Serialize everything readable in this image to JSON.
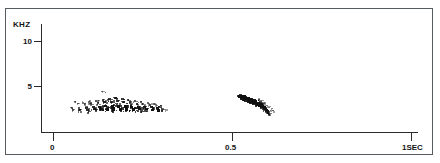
{
  "figure": {
    "type": "spectrogram",
    "background_color": "#ffffff",
    "ink_color": "#101010",
    "frame_color": "#555b5e",
    "axis_color": "#2b2b2b"
  },
  "yaxis": {
    "unit_label": "KHZ",
    "ticks": [
      {
        "label": "10",
        "value": 10
      },
      {
        "label": "5",
        "value": 5
      }
    ],
    "range": [
      0,
      12.2
    ]
  },
  "xaxis": {
    "ticks": [
      {
        "label": "0",
        "value": 0
      },
      {
        "label": "0.5",
        "value": 0.5
      },
      {
        "label": "1SEC",
        "value": 1.0
      }
    ],
    "range": [
      0,
      1.0
    ]
  },
  "chart_data": {
    "type": "scatter",
    "title": "",
    "xlabel": "",
    "ylabel": "KHZ",
    "xlim": [
      0,
      1.0
    ],
    "ylim": [
      0,
      12.2
    ],
    "grid": false,
    "legend": null,
    "series": [
      {
        "name": "low-frequency-buzz-band",
        "description": "Dense horizontal band of short broadband pulses near 2.2-3.3 kHz extending from about 0.05 s to 0.31 s.",
        "points": [
          [
            0.052,
            2.52,
            1.4
          ],
          [
            0.056,
            2.4,
            1.1
          ],
          [
            0.061,
            3.2,
            0.9
          ],
          [
            0.068,
            3.05,
            0.9
          ],
          [
            0.074,
            2.55,
            1.6
          ],
          [
            0.076,
            2.32,
            1.8
          ],
          [
            0.083,
            3.18,
            1.0
          ],
          [
            0.09,
            3.02,
            1.1
          ],
          [
            0.094,
            2.6,
            2.0
          ],
          [
            0.096,
            2.35,
            2.2
          ],
          [
            0.101,
            3.25,
            1.2
          ],
          [
            0.107,
            3.1,
            1.4
          ],
          [
            0.112,
            2.62,
            2.3
          ],
          [
            0.115,
            2.38,
            2.4
          ],
          [
            0.121,
            3.3,
            1.5
          ],
          [
            0.126,
            3.12,
            1.6
          ],
          [
            0.131,
            2.66,
            2.5
          ],
          [
            0.134,
            2.4,
            2.6
          ],
          [
            0.139,
            3.42,
            1.8
          ],
          [
            0.144,
            3.2,
            2.0
          ],
          [
            0.148,
            2.7,
            2.7
          ],
          [
            0.152,
            2.42,
            2.8
          ],
          [
            0.157,
            3.55,
            2.1
          ],
          [
            0.162,
            3.26,
            2.2
          ],
          [
            0.166,
            2.72,
            2.8
          ],
          [
            0.17,
            2.44,
            2.9
          ],
          [
            0.175,
            3.6,
            2.3
          ],
          [
            0.18,
            3.28,
            2.2
          ],
          [
            0.184,
            2.74,
            2.9
          ],
          [
            0.188,
            2.46,
            3.0
          ],
          [
            0.193,
            3.52,
            2.0
          ],
          [
            0.198,
            3.22,
            1.9
          ],
          [
            0.202,
            2.72,
            2.8
          ],
          [
            0.206,
            2.44,
            2.9
          ],
          [
            0.211,
            3.4,
            1.7
          ],
          [
            0.216,
            3.14,
            1.6
          ],
          [
            0.22,
            2.68,
            2.7
          ],
          [
            0.224,
            2.42,
            2.8
          ],
          [
            0.229,
            3.3,
            1.5
          ],
          [
            0.234,
            3.05,
            1.4
          ],
          [
            0.238,
            2.66,
            2.6
          ],
          [
            0.242,
            2.4,
            2.7
          ],
          [
            0.247,
            3.22,
            1.3
          ],
          [
            0.252,
            3.0,
            1.2
          ],
          [
            0.256,
            2.64,
            2.5
          ],
          [
            0.26,
            2.38,
            2.6
          ],
          [
            0.265,
            3.12,
            1.1
          ],
          [
            0.27,
            2.95,
            1.0
          ],
          [
            0.274,
            2.62,
            2.4
          ],
          [
            0.278,
            2.36,
            2.5
          ],
          [
            0.283,
            3.02,
            1.0
          ],
          [
            0.288,
            2.88,
            0.9
          ],
          [
            0.292,
            2.58,
            2.6
          ],
          [
            0.296,
            2.34,
            2.9
          ],
          [
            0.301,
            2.8,
            0.9
          ],
          [
            0.307,
            2.5,
            1.2
          ],
          [
            0.313,
            2.38,
            0.9
          ]
        ]
      },
      {
        "name": "faint-upper-specks",
        "description": "Two faint isolated specks just above the buzz band near 4.3 kHz at about 0.14 s.",
        "points": [
          [
            0.136,
            4.35,
            0.8
          ],
          [
            0.148,
            4.3,
            0.6
          ]
        ]
      },
      {
        "name": "downsweep-click-cluster",
        "description": "Dense dark cluster sweeping downward from about 3.9 kHz at 0.52 s to about 1.9 kHz at 0.59 s.",
        "points": [
          [
            0.521,
            3.85,
            3.0
          ],
          [
            0.526,
            3.9,
            3.2
          ],
          [
            0.53,
            3.72,
            3.4
          ],
          [
            0.535,
            3.8,
            3.3
          ],
          [
            0.539,
            3.58,
            3.6
          ],
          [
            0.543,
            3.66,
            3.4
          ],
          [
            0.547,
            3.44,
            3.6
          ],
          [
            0.551,
            3.52,
            3.5
          ],
          [
            0.555,
            3.3,
            3.5
          ],
          [
            0.559,
            3.38,
            3.3
          ],
          [
            0.563,
            3.16,
            3.4
          ],
          [
            0.567,
            3.24,
            3.2
          ],
          [
            0.57,
            3.02,
            3.2
          ],
          [
            0.574,
            3.1,
            3.0
          ],
          [
            0.578,
            2.88,
            3.0
          ],
          [
            0.582,
            2.96,
            2.8
          ],
          [
            0.585,
            2.74,
            2.8
          ],
          [
            0.589,
            2.6,
            2.6
          ],
          [
            0.592,
            2.46,
            2.4
          ],
          [
            0.595,
            2.32,
            2.2
          ],
          [
            0.598,
            2.18,
            2.0
          ],
          [
            0.601,
            2.04,
            1.8
          ],
          [
            0.604,
            1.92,
            1.5
          ],
          [
            0.574,
            3.52,
            1.0
          ],
          [
            0.58,
            3.34,
            1.0
          ],
          [
            0.586,
            3.18,
            0.9
          ],
          [
            0.592,
            2.98,
            0.9
          ],
          [
            0.598,
            2.8,
            0.9
          ],
          [
            0.604,
            2.62,
            0.9
          ],
          [
            0.61,
            2.44,
            0.8
          ],
          [
            0.615,
            2.26,
            0.8
          ]
        ]
      }
    ]
  }
}
